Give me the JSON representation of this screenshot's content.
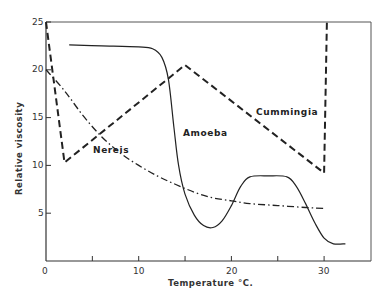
{
  "chart_data": {
    "type": "line",
    "title": "",
    "xlabel": "Temperature °C.",
    "ylabel": "Relative viscosity",
    "xlim": [
      0,
      35
    ],
    "ylim": [
      0,
      25
    ],
    "x_ticks": [
      0,
      10,
      20,
      30
    ],
    "x_minor_ticks": [
      5,
      15,
      25
    ],
    "y_ticks": [
      5,
      10,
      15,
      20,
      25
    ],
    "grid": false,
    "legend": "inline labels",
    "series": [
      {
        "name": "Cummingia",
        "style": "dashed",
        "label_pos": [
          22.5,
          12
        ],
        "points": [
          [
            0,
            25
          ],
          [
            2,
            10.3
          ],
          [
            15,
            20.5
          ],
          [
            30,
            9.2
          ],
          [
            30.3,
            25
          ]
        ]
      },
      {
        "name": "Nereis",
        "style": "dash-dot",
        "label_pos": [
          5.2,
          10.2
        ],
        "points": [
          [
            0,
            20
          ],
          [
            2,
            17.8
          ],
          [
            4,
            15.2
          ],
          [
            6,
            13
          ],
          [
            8,
            11.3
          ],
          [
            10,
            10
          ],
          [
            12,
            8.9
          ],
          [
            14,
            8
          ],
          [
            16,
            7.2
          ],
          [
            18,
            6.6
          ],
          [
            20,
            6.3
          ],
          [
            22,
            6
          ],
          [
            25,
            5.8
          ],
          [
            28,
            5.6
          ],
          [
            30,
            5.5
          ]
        ]
      },
      {
        "name": "Amoeba",
        "style": "solid",
        "label_pos": [
          14.8,
          12.2
        ],
        "points": [
          [
            2.5,
            22.6
          ],
          [
            6,
            22.5
          ],
          [
            10,
            22.4
          ],
          [
            11.5,
            22.2
          ],
          [
            12.5,
            21.3
          ],
          [
            13.2,
            19
          ],
          [
            13.8,
            14
          ],
          [
            14.3,
            10
          ],
          [
            15,
            7
          ],
          [
            16,
            4.8
          ],
          [
            17,
            3.7
          ],
          [
            18,
            3.5
          ],
          [
            19,
            4.2
          ],
          [
            20,
            5.8
          ],
          [
            21,
            7.8
          ],
          [
            22,
            8.8
          ],
          [
            24,
            8.9
          ],
          [
            26,
            8.8
          ],
          [
            27,
            7.8
          ],
          [
            28,
            6
          ],
          [
            29,
            4
          ],
          [
            30,
            2.4
          ],
          [
            31,
            1.8
          ],
          [
            32.3,
            1.8
          ]
        ]
      }
    ]
  },
  "labels": {
    "xlabel": "Temperature °C.",
    "ylabel": "Relative viscosity",
    "x_tick_0": "0",
    "x_tick_10": "10",
    "x_tick_20": "20",
    "x_tick_30": "30",
    "y_tick_5": "5",
    "y_tick_10": "10",
    "y_tick_15": "15",
    "y_tick_20": "20",
    "y_tick_25": "25",
    "cummingia": "Cummingia",
    "nereis": "Nereis",
    "amoeba": "Amoeba"
  }
}
